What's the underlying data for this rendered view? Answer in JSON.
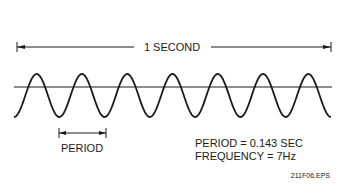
{
  "diagram": {
    "type": "sine-wave-frequency",
    "duration_label": "1 SECOND",
    "period_label": "PERIOD",
    "info_lines": [
      "PERIOD = 0.143 SEC",
      "FREQUENCY = 7Hz"
    ],
    "figure_id": "211F06.EPS",
    "cycles": 7,
    "colors": {
      "ink": "#1a1a1a",
      "background": "#ffffff"
    }
  }
}
